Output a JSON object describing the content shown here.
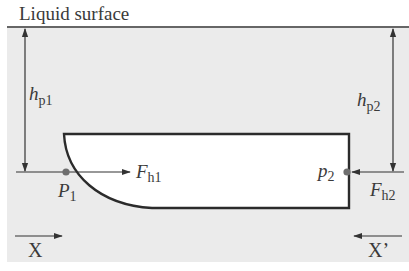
{
  "title": "Liquid surface",
  "colors": {
    "liquid": "#ebebeb",
    "body_fill": "#ffffff",
    "outline": "#2b2b2b",
    "line": "#333333",
    "point": "#6e6e6e",
    "text": "#3a3a3a"
  },
  "labels": {
    "hp1": {
      "main": "h",
      "sub": "p1"
    },
    "hp2": {
      "main": "h",
      "sub": "p2"
    },
    "P1": {
      "main": "P",
      "sub": "1"
    },
    "p2": {
      "main": "p",
      "sub": "2"
    },
    "Fh1": {
      "main": "F",
      "sub": "h1"
    },
    "Fh2": {
      "main": "F",
      "sub": "h2"
    },
    "X": "X",
    "Xprime": "X’"
  }
}
